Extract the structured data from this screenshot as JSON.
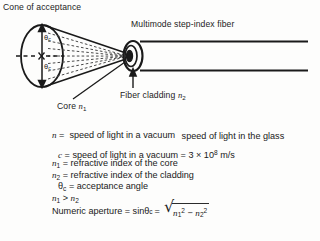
{
  "figure": {
    "background_color": "#fdfdfc",
    "ink_color": "#1a1a1a"
  },
  "diagram": {
    "labels": {
      "cone_of_acceptance": "Cone of acceptance",
      "multimode_fiber": "Multimode step-index fiber",
      "fiber_cladding_text": "Fiber cladding ",
      "fiber_cladding_symbol": "n",
      "fiber_cladding_subscript": "2",
      "core_text": "Core ",
      "core_symbol": "n",
      "core_subscript": "1",
      "theta_top": "θ",
      "theta_top_sub": "c",
      "theta_bottom": "θ",
      "theta_bottom_sub": "c"
    }
  },
  "formulas": {
    "refractive_index": {
      "lhs_symbol": "n",
      "equals": "=",
      "numerator": "speed of light in a vacuum",
      "denominator": "speed of light in the glass"
    },
    "speed_of_light": {
      "symbol": "c",
      "text": "= speed of light in a vacuum = 3 × 10",
      "exponent": "8",
      "units": " m/s"
    },
    "n1_definition": {
      "symbol": "n",
      "subscript": "1",
      "text": "= refractive index of the core"
    },
    "n2_definition": {
      "symbol": "n",
      "subscript": "2",
      "text": "= refractive index of the cladding"
    },
    "theta_c_definition": {
      "symbol": "θ",
      "subscript": "c",
      "text": "= acceptance angle"
    },
    "inequality": {
      "left_symbol": "n",
      "left_sub": "1",
      "operator": "> ",
      "right_symbol": "n",
      "right_sub": "2"
    },
    "numeric_aperture": {
      "label": "Numeric aperture = sin ",
      "theta": "θ",
      "theta_sub": "c",
      "equals": "=",
      "radical_glyph": "√",
      "radicand_first_symbol": "n",
      "radicand_first_sub": "1",
      "radicand_first_sup": "2",
      "radicand_minus": " − ",
      "radicand_second_symbol": "n",
      "radicand_second_sub": "2",
      "radicand_second_sup": "2"
    }
  }
}
